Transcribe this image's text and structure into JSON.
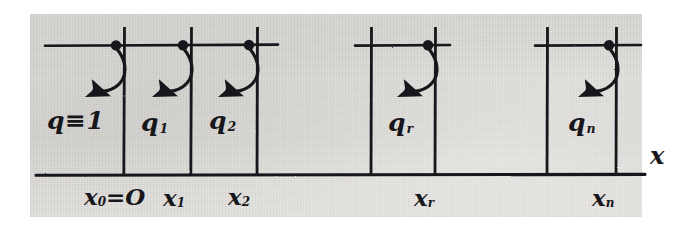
{
  "figure": {
    "axis_label": "x",
    "background_color": "#e0dedb",
    "ink_color": "#17161a",
    "elements": [
      {
        "key": "e0",
        "q_label_base": "q",
        "q_label_sub": "",
        "q_label_full": "q≡1"
      },
      {
        "key": "e1",
        "q_label_base": "q",
        "q_label_sub": "1",
        "q_label_full": "q1"
      },
      {
        "key": "e2",
        "q_label_base": "q",
        "q_label_sub": "2",
        "q_label_full": "q2"
      },
      {
        "key": "er",
        "q_label_base": "q",
        "q_label_sub": "r",
        "q_label_full": "qr"
      },
      {
        "key": "en",
        "q_label_base": "q",
        "q_label_sub": "n",
        "q_label_full": "qn"
      }
    ],
    "nodes": [
      {
        "key": "x0",
        "base": "x",
        "sub": "0",
        "suffix": "=O",
        "full": "x0=O"
      },
      {
        "key": "x1",
        "base": "x",
        "sub": "1",
        "suffix": "",
        "full": "x1"
      },
      {
        "key": "x2",
        "base": "x",
        "sub": "2",
        "suffix": "",
        "full": "x2"
      },
      {
        "key": "xr",
        "base": "x",
        "sub": "r",
        "suffix": "",
        "full": "xr"
      },
      {
        "key": "xn",
        "base": "x",
        "sub": "n",
        "suffix": "",
        "full": "xn"
      }
    ]
  }
}
